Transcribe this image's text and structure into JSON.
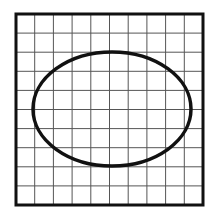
{
  "figure": {
    "grid": {
      "columns": 10,
      "rows": 10,
      "x0": 16,
      "y0": 14,
      "x1": 203,
      "y1": 205,
      "frame_color": "#111111",
      "line_color": "#555555"
    },
    "ellipse": {
      "cx": 112,
      "cy": 109,
      "rx": 79,
      "ry": 57,
      "stroke": "#111111",
      "stroke_width": 3.5
    }
  }
}
